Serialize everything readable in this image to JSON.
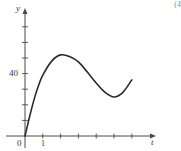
{
  "corner_note": "(4",
  "chart_data": {
    "type": "line",
    "title": "",
    "xlabel": "t",
    "ylabel": "y",
    "x_tick_labels": [
      {
        "value": 0,
        "label": "0"
      },
      {
        "value": 1,
        "label": "1"
      }
    ],
    "y_tick_labels": [
      {
        "value": 40,
        "label": "40"
      }
    ],
    "x_ticks": [
      1,
      2,
      3,
      4,
      5,
      6
    ],
    "y_ticks": [
      10,
      20,
      30,
      40,
      50,
      60,
      70
    ],
    "xlim": [
      0,
      7.3
    ],
    "ylim": [
      0,
      82
    ],
    "grid": false,
    "legend": null,
    "series": [
      {
        "name": "y(t)",
        "x": [
          0,
          0.25,
          0.5,
          0.75,
          1,
          1.5,
          2,
          2.5,
          3,
          3.5,
          4,
          4.5,
          5,
          5.5,
          6
        ],
        "values": [
          0,
          12,
          23,
          32,
          39,
          48,
          52,
          51,
          47.5,
          41,
          34,
          28,
          25,
          28,
          36
        ]
      }
    ],
    "curve_features": {
      "start": [
        0,
        0
      ],
      "local_max": [
        2,
        52
      ],
      "local_min": [
        5,
        25
      ],
      "end": [
        6,
        36
      ]
    }
  },
  "style": {
    "axis_color": "#4a4a4a",
    "curve_color": "#2a2a2a",
    "label_color": "#3a3a3a"
  },
  "layout": {
    "origin_px": [
      25,
      136
    ],
    "x_unit_px": 17.8,
    "y_unit_px": 1.56,
    "x_axis_end_px": 156,
    "y_axis_top_px": 8
  }
}
